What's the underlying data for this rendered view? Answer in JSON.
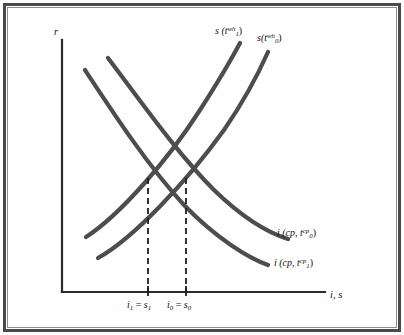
{
  "figure": {
    "kind": "economics-diagram",
    "border_color": "#4a4a4a",
    "curve_color": "#4d4d4d",
    "axis_color": "#2b2b2b",
    "background": "#fdfdfd"
  },
  "axes": {
    "y_label": "r",
    "x_label": "i, s",
    "origin": {
      "x": 62,
      "y": 292
    },
    "y_top": {
      "x": 62,
      "y": 40
    },
    "x_right": {
      "x": 325,
      "y": 292
    }
  },
  "labels": {
    "savings_1": {
      "base": "s (t",
      "sub": "1",
      "sup": "wh",
      "close": ")"
    },
    "savings_0": {
      "base": "s(t",
      "sub": "0",
      "sup": "wh",
      "close": ")"
    },
    "investment_0": {
      "base": "i (cp, t",
      "sub": "0",
      "sup": "cp",
      "close": ")"
    },
    "investment_1": {
      "base": "i (cp, t",
      "sub": "1",
      "sup": "cp",
      "close": ")"
    }
  },
  "ticks": [
    {
      "id": "eq1",
      "x": 148,
      "text_lhs": "i",
      "text_lhs_sub": "1",
      "eq": " = ",
      "text_rhs": "s",
      "text_rhs_sub": "1"
    },
    {
      "id": "eq0",
      "x": 186,
      "text_lhs": "i",
      "text_lhs_sub": "0",
      "eq": " = ",
      "text_rhs": "s",
      "text_rhs_sub": "0"
    }
  ],
  "chart_data": {
    "type": "line",
    "title": "",
    "xlabel": "i, s",
    "ylabel": "r",
    "grid": false,
    "legend": "inline-curve-labels",
    "xlim": [
      62,
      325
    ],
    "ylim": [
      292,
      40
    ],
    "note": "Coordinates are in screen pixels; y increases downward. Savings curves slope upward (r rises with s); investment curves slope downward (r falls with i).",
    "series": [
      {
        "name": "s (t_1^wh)",
        "role": "savings",
        "direction": "upward-sloping",
        "label_position": "top",
        "path": "M 86 237 C 120 215, 168 160, 200 110 C 218 82, 232 58, 240 43",
        "endpoints": [
          [
            86,
            237
          ],
          [
            240,
            43
          ]
        ]
      },
      {
        "name": "s (t_0^wh)",
        "role": "savings",
        "direction": "upward-sloping",
        "label_position": "top",
        "path": "M 98 258 C 134 238, 188 180, 224 130 C 246 98, 260 70, 268 52",
        "endpoints": [
          [
            98,
            258
          ],
          [
            268,
            52
          ]
        ]
      },
      {
        "name": "i (cp, t_0^cp)",
        "role": "investment",
        "direction": "downward-sloping",
        "label_position": "right",
        "path": "M 108 58 C 140 100, 176 152, 214 190 C 246 221, 272 234, 288 239",
        "endpoints": [
          [
            108,
            58
          ],
          [
            288,
            239
          ]
        ]
      },
      {
        "name": "i (cp, t_1^cp)",
        "role": "investment",
        "direction": "downward-sloping",
        "label_position": "right",
        "path": "M 85 70 C 114 114, 148 166, 184 205 C 216 238, 248 258, 268 265",
        "endpoints": [
          [
            85,
            70
          ],
          [
            268,
            265
          ]
        ]
      }
    ],
    "equilibria": [
      {
        "label": "i_1 = s_1",
        "x": 148,
        "y": 178,
        "dash_from_y": 178,
        "dash_to_y": 292
      },
      {
        "label": "i_0 = s_0",
        "x": 186,
        "y": 178,
        "dash_from_y": 178,
        "dash_to_y": 292
      }
    ]
  }
}
